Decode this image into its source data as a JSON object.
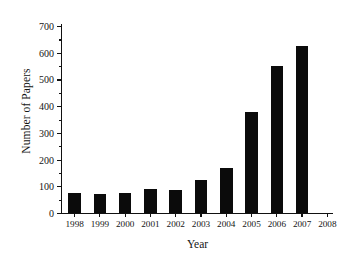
{
  "chart_data": {
    "type": "bar",
    "title": "",
    "xlabel": "Year",
    "ylabel": "Number of Papers",
    "categories": [
      "1998",
      "1999",
      "2000",
      "2001",
      "2002",
      "2003",
      "2004",
      "2005",
      "2006",
      "2007"
    ],
    "values": [
      75,
      70,
      75,
      90,
      85,
      125,
      170,
      380,
      550,
      625
    ],
    "ylim": [
      0,
      700
    ],
    "ytick_labels": [
      "0",
      "100",
      "200",
      "300",
      "400",
      "500",
      "600",
      "700"
    ],
    "ytick_values": [
      0,
      100,
      200,
      300,
      400,
      500,
      600,
      700
    ],
    "yminor_step": 50,
    "xtick_labels": [
      "1998",
      "1999",
      "2000",
      "2001",
      "2002",
      "2003",
      "2004",
      "2005",
      "2006",
      "2007",
      "2008"
    ],
    "grid": false,
    "legend": false,
    "bar_color": "#0b0b0b",
    "axis_color": "#111111",
    "background": "#ffffff"
  }
}
